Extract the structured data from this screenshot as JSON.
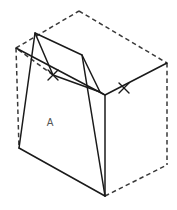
{
  "figure": {
    "label_a": "A",
    "label_a_position": {
      "x": 50,
      "y": 123
    },
    "colors": {
      "solid_line": "#1a1a1a",
      "hidden_line": "#3a3a3a",
      "background": "#ffffff",
      "label_text": "#555555"
    },
    "line_styles": {
      "solid": "visible edge",
      "dashed": "hidden edge"
    }
  },
  "geometry": {
    "vertices": {
      "box_top_back": {
        "x": 79,
        "y": 11
      },
      "box_top_left": {
        "x": 16,
        "y": 48
      },
      "box_top_right": {
        "x": 167,
        "y": 63
      },
      "box_top_front": {
        "x": 105,
        "y": 95
      },
      "box_bottom_left": {
        "x": 19,
        "y": 148
      },
      "box_bottom_front": {
        "x": 105,
        "y": 196
      },
      "box_bottom_right": {
        "x": 167,
        "y": 165
      },
      "cut_top_left": {
        "x": 35,
        "y": 33
      },
      "cut_top_right": {
        "x": 82,
        "y": 55
      },
      "cut_mid_left": {
        "x": 53,
        "y": 75
      },
      "cut_mid_right": {
        "x": 100,
        "y": 92
      }
    },
    "tick_marks": [
      {
        "name": "tick-left",
        "x": 53,
        "y": 75
      },
      {
        "name": "tick-right",
        "x": 124,
        "y": 88
      }
    ]
  },
  "paths": {
    "box_solid_outline": "M 16 48 L 105 95 L 167 63",
    "box_front_vertical": "M 105 95 L 105 196",
    "box_bottom_left_edge": "M 19 148 L 105 196",
    "box_left_vertical_hidden": "M 16 48 L 19 148",
    "box_top_back_left_hidden": "M 16 48 L 79 11",
    "box_top_back_right_hidden": "M 79 11 L 167 63",
    "box_right_vertical_hidden": "M 167 63 L 167 165",
    "box_bottom_right_edge_hidden": "M 105 196 L 167 165",
    "cut_top_face": "M 35 33 L 82 55 L 100 92 L 53 75 Z",
    "cut_left_slope": "M 35 33 L 19 148",
    "cut_right_slope": "M 82 55 L 105 196",
    "cut_inner_left_hidden": "M 53 75 L 16 48",
    "cut_inner_right_hidden": "M 100 92 L 105 95"
  }
}
